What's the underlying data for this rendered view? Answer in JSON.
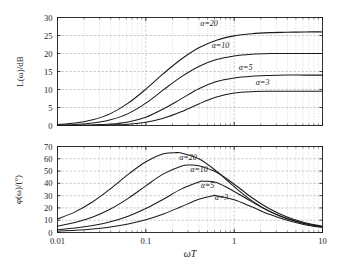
{
  "chart_data": [
    {
      "type": "line",
      "panel": "magnitude",
      "title": "",
      "xlabel": "ωT",
      "ylabel": "L(ω)/dB",
      "xscale": "log",
      "xlim": [
        0.01,
        10
      ],
      "ylim": [
        0,
        30
      ],
      "xticks": [
        0.01,
        0.1,
        1,
        10
      ],
      "xticklabels": [
        "0.01",
        "0.1",
        "1",
        "10"
      ],
      "yticks": [
        0,
        5,
        10,
        15,
        20,
        25,
        30
      ],
      "yticklabels": [
        "0",
        "5",
        "10",
        "15",
        "20",
        "25",
        "30"
      ],
      "grid": true,
      "grid_minor": true,
      "legend": "inline-annotations",
      "series": [
        {
          "name": "α=20",
          "label": "α=20",
          "asymptote_db": 26.0,
          "x": [
            0.01,
            0.0158,
            0.0251,
            0.0398,
            0.0631,
            0.1,
            0.158,
            0.251,
            0.398,
            0.631,
            1.0,
            1.58,
            2.51,
            3.98,
            6.31,
            10.0
          ],
          "values": [
            0.3,
            0.7,
            1.6,
            3.3,
            6.2,
            10.1,
            14.4,
            18.4,
            21.6,
            23.7,
            24.9,
            25.5,
            25.8,
            25.9,
            26.0,
            26.0
          ]
        },
        {
          "name": "α=10",
          "label": "α=10",
          "asymptote_db": 20.0,
          "x": [
            0.01,
            0.0158,
            0.0251,
            0.0398,
            0.0631,
            0.1,
            0.158,
            0.251,
            0.398,
            0.631,
            1.0,
            1.58,
            2.51,
            3.98,
            6.31,
            10.0
          ],
          "values": [
            0.1,
            0.3,
            0.7,
            1.6,
            3.3,
            6.2,
            9.9,
            13.5,
            16.4,
            18.3,
            19.3,
            19.8,
            20.0,
            20.0,
            20.0,
            20.0
          ]
        },
        {
          "name": "α=5",
          "label": "α=5",
          "asymptote_db": 14.0,
          "x": [
            0.01,
            0.0158,
            0.0251,
            0.0398,
            0.0631,
            0.1,
            0.158,
            0.251,
            0.398,
            0.631,
            1.0,
            1.58,
            2.51,
            3.98,
            6.31,
            10.0
          ],
          "values": [
            0.02,
            0.06,
            0.16,
            0.4,
            1.0,
            2.3,
            4.6,
            7.4,
            10.2,
            12.2,
            13.2,
            13.7,
            13.9,
            14.0,
            14.0,
            14.0
          ]
        },
        {
          "name": "α=3",
          "label": "α=3",
          "asymptote_db": 9.5,
          "x": [
            0.01,
            0.0158,
            0.0251,
            0.0398,
            0.0631,
            0.1,
            0.158,
            0.251,
            0.398,
            0.631,
            1.0,
            1.58,
            2.51,
            3.98,
            6.31,
            10.0
          ],
          "values": [
            0.01,
            0.02,
            0.06,
            0.15,
            0.37,
            0.9,
            2.0,
            3.8,
            6.0,
            7.9,
            9.0,
            9.4,
            9.5,
            9.5,
            9.5,
            9.5
          ]
        }
      ]
    },
    {
      "type": "line",
      "panel": "phase",
      "title": "",
      "xlabel": "ωT",
      "ylabel": "φ(ω)/(°)",
      "xscale": "log",
      "xlim": [
        0.01,
        10
      ],
      "ylim": [
        0,
        70
      ],
      "xticks": [
        0.01,
        0.1,
        1,
        10
      ],
      "xticklabels": [
        "0.01",
        "0.1",
        "1",
        "10"
      ],
      "yticks": [
        0,
        10,
        20,
        30,
        40,
        50,
        60,
        70
      ],
      "yticklabels": [
        "0",
        "10",
        "20",
        "30",
        "40",
        "50",
        "60",
        "70"
      ],
      "grid": true,
      "grid_minor": true,
      "legend": "inline-annotations",
      "series": [
        {
          "name": "α=20",
          "label": "α=20",
          "peak_deg": 65.0,
          "peak_x": 0.224,
          "x": [
            0.01,
            0.0158,
            0.0251,
            0.0398,
            0.0631,
            0.1,
            0.158,
            0.224,
            0.251,
            0.398,
            0.631,
            1.0,
            1.58,
            2.51,
            3.98,
            6.31,
            10.0
          ],
          "values": [
            11.0,
            16.8,
            25.0,
            35.6,
            47.3,
            57.6,
            64.0,
            65.0,
            64.7,
            60.0,
            49.9,
            37.3,
            25.9,
            17.2,
            11.1,
            7.1,
            4.5
          ]
        },
        {
          "name": "α=10",
          "label": "α=10",
          "peak_deg": 54.9,
          "peak_x": 0.316,
          "x": [
            0.01,
            0.0158,
            0.0251,
            0.0398,
            0.0631,
            0.1,
            0.158,
            0.251,
            0.316,
            0.398,
            0.631,
            1.0,
            1.58,
            2.51,
            3.98,
            6.31,
            10.0
          ],
          "values": [
            5.2,
            8.1,
            12.6,
            19.1,
            27.8,
            38.0,
            47.7,
            54.0,
            54.9,
            54.3,
            49.0,
            39.3,
            28.5,
            19.3,
            12.6,
            8.0,
            5.1
          ]
        },
        {
          "name": "α=5",
          "label": "α=5",
          "peak_deg": 41.8,
          "peak_x": 0.447,
          "x": [
            0.01,
            0.0158,
            0.0251,
            0.0398,
            0.0631,
            0.1,
            0.158,
            0.251,
            0.398,
            0.447,
            0.631,
            1.0,
            1.58,
            2.51,
            3.98,
            6.31,
            10.0
          ],
          "values": [
            2.3,
            3.6,
            5.7,
            8.8,
            13.3,
            19.5,
            27.1,
            35.3,
            41.1,
            41.8,
            40.7,
            33.4,
            25.1,
            17.3,
            11.4,
            7.4,
            4.7
          ]
        },
        {
          "name": "α=3",
          "label": "α=3",
          "peak_deg": 30.0,
          "peak_x": 0.577,
          "x": [
            0.01,
            0.0158,
            0.0251,
            0.0398,
            0.0631,
            0.1,
            0.158,
            0.251,
            0.398,
            0.577,
            0.631,
            1.0,
            1.58,
            2.51,
            3.98,
            6.31,
            10.0
          ],
          "values": [
            1.1,
            1.8,
            2.9,
            4.5,
            6.9,
            10.3,
            15.0,
            21.0,
            27.0,
            30.0,
            29.9,
            26.6,
            20.9,
            14.8,
            9.9,
            6.4,
            4.1
          ]
        }
      ]
    }
  ],
  "figure": {
    "xaxis_title": "ωT",
    "background": "#ffffff",
    "curve_color": "#1a1a1a",
    "grid_color": "#9a9a9a",
    "axis_color": "#1a1a1a"
  },
  "top_panel": {
    "ylabel": "L(ω)/dB",
    "yticklabels": [
      "0",
      "5",
      "10",
      "15",
      "20",
      "25",
      "30"
    ],
    "annotations": [
      "α=20",
      "α=10",
      "α=5",
      "α=3"
    ]
  },
  "bottom_panel": {
    "ylabel": "φ(ω)/(°)",
    "yticklabels": [
      "0",
      "10",
      "20",
      "30",
      "40",
      "50",
      "60",
      "70"
    ],
    "xticklabels": [
      "0.01",
      "0.1",
      "1",
      "10"
    ],
    "annotations": [
      "α=20",
      "α=10",
      "α=5",
      "α=3"
    ]
  }
}
